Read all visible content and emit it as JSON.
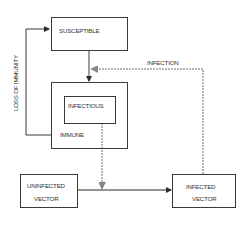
{
  "diagram": {
    "type": "compartment-flow",
    "nodes": {
      "susceptible": {
        "label": "SUSCEPTIBLE"
      },
      "immune": {
        "label": "IMMUNE"
      },
      "infectious": {
        "label": "INFECTIOUS"
      },
      "uninfected_vector": {
        "line1": "UNINFECTED",
        "line2": "VECTOR"
      },
      "infected_vector": {
        "line1": "INFECTED",
        "line2": "VECTOR"
      }
    },
    "edges": {
      "loss_of_immunity": {
        "label": "LOSS OF IMMUNITY",
        "from": "immune",
        "to": "susceptible",
        "style": "solid"
      },
      "infection": {
        "label": "INFECTION",
        "from": "infected_vector",
        "to": "susceptible-immune link",
        "style": "dashed"
      },
      "susceptible_to_immune": {
        "from": "susceptible",
        "to": "immune",
        "style": "solid"
      },
      "infectious_to_vector": {
        "from": "infectious",
        "to": "uninfected-infected vector link",
        "style": "dashed"
      },
      "vector_infection": {
        "from": "uninfected_vector",
        "to": "infected_vector",
        "style": "solid"
      }
    },
    "colors": {
      "line": "#3a3a3a",
      "dashed": "#6a6a6a",
      "text": "#333333",
      "background": "#ffffff"
    }
  }
}
